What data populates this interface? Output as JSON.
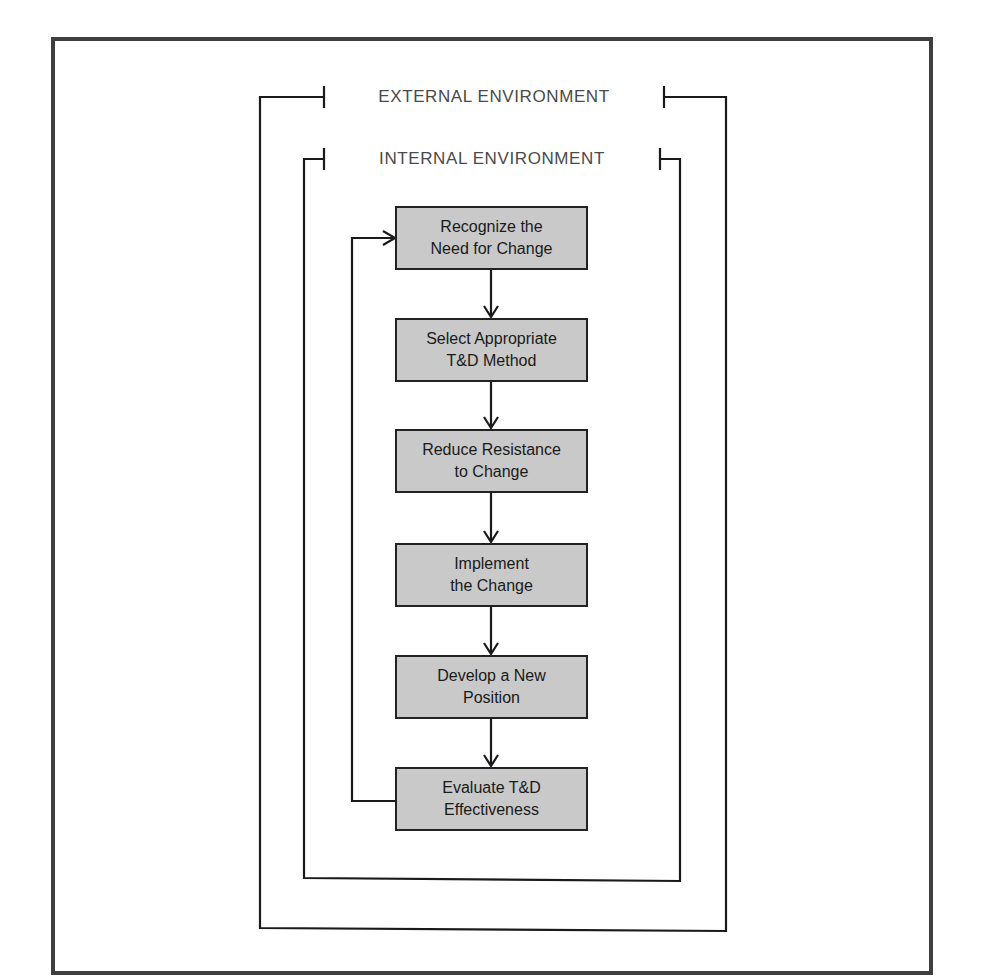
{
  "diagram": {
    "outer_label": "EXTERNAL ENVIRONMENT",
    "inner_label": "INTERNAL ENVIRONMENT",
    "steps": [
      {
        "line1": "Recognize the",
        "line2": "Need for Change"
      },
      {
        "line1": "Select Appropriate",
        "line2": "T&D Method"
      },
      {
        "line1": "Reduce Resistance",
        "line2": "to Change"
      },
      {
        "line1": "Implement",
        "line2": "the Change"
      },
      {
        "line1": "Develop a New",
        "line2": "Position"
      },
      {
        "line1": "Evaluate T&D",
        "line2": "Effectiveness"
      }
    ],
    "feedback_loop": "Evaluate T&D Effectiveness returns to Recognize the Need for Change",
    "colors": {
      "box_fill": "#c9c9c9",
      "border": "#222222",
      "frame": "#3f3f3f",
      "label_text": "#4a4a4a"
    }
  }
}
